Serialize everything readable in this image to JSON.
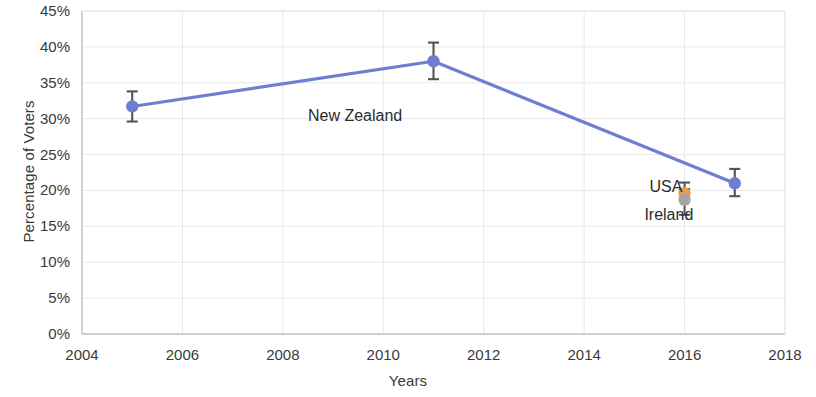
{
  "chart_data": {
    "type": "line",
    "title": "",
    "xlabel": "Years",
    "ylabel": "Percentage of Voters",
    "xlim": [
      2004,
      2018
    ],
    "ylim": [
      0,
      45
    ],
    "grid": true,
    "legend": "annotations-on-plot",
    "x_ticks": [
      "2004",
      "2006",
      "2008",
      "2010",
      "2012",
      "2014",
      "2016",
      "2018"
    ],
    "x_tick_values": [
      2004,
      2006,
      2008,
      2010,
      2012,
      2014,
      2016,
      2018
    ],
    "y_ticks": [
      "0%",
      "5%",
      "10%",
      "15%",
      "20%",
      "25%",
      "30%",
      "35%",
      "40%",
      "45%"
    ],
    "y_tick_values": [
      0,
      5,
      10,
      15,
      20,
      25,
      30,
      35,
      40,
      45
    ],
    "series": [
      {
        "name": "New Zealand",
        "color": "#6E7FD2",
        "marker": "circle",
        "connected": true,
        "points": [
          {
            "x": 2005,
            "y": 31.7,
            "yerr_low": 29.6,
            "yerr_high": 33.8
          },
          {
            "x": 2011,
            "y": 38.0,
            "yerr_low": 35.5,
            "yerr_high": 40.6
          },
          {
            "x": 2017,
            "y": 21.0,
            "yerr_low": 19.2,
            "yerr_high": 23.0
          }
        ]
      },
      {
        "name": "USA",
        "color": "#ED9C4E",
        "marker": "circle",
        "connected": false,
        "points": [
          {
            "x": 2016,
            "y": 19.6,
            "yerr_low": 18.6,
            "yerr_high": 21.1
          }
        ]
      },
      {
        "name": "Ireland",
        "color": "#A5A5A5",
        "marker": "circle",
        "connected": false,
        "points": [
          {
            "x": 2016,
            "y": 18.7,
            "yerr_low": 16.6,
            "yerr_high": 20.2
          }
        ]
      }
    ],
    "annotations": [
      {
        "text": "New Zealand",
        "x": 2008.5,
        "y": 30.3,
        "color": "#2b2b2b"
      },
      {
        "text": "USA",
        "x": 2015.3,
        "y": 20.4,
        "color": "#2b2b2b"
      },
      {
        "text": "Ireland",
        "x": 2015.2,
        "y": 16.5,
        "color": "#2b2b2b"
      }
    ]
  },
  "colors": {
    "series_new_zealand": "#6E7FD2",
    "series_usa": "#ED9C4E",
    "series_ireland": "#A5A5A5",
    "grid": "#E8E8E8",
    "axis": "#BFBFBF",
    "errorbar": "#545454",
    "text": "#3a3a3a",
    "background": "#FFFFFF"
  }
}
